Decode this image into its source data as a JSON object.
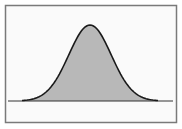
{
  "diagram": {
    "type": "normal-distribution-curve",
    "distribution": {
      "mean": 0,
      "std_dev": 1,
      "x_range": [
        -3.2,
        3.2
      ]
    },
    "colors": {
      "background": "#fafafa",
      "frame": "#7a7a7a",
      "fill": "#b8b8b8",
      "curve": "#1a1a1a",
      "baseline": "#333333"
    }
  }
}
